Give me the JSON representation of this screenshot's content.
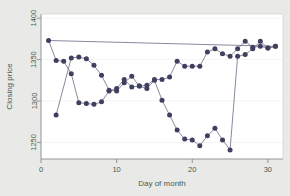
{
  "chart_data": {
    "type": "line",
    "title": "",
    "xlabel": "Day of month",
    "ylabel": "Closing price",
    "xlim": [
      0,
      32
    ],
    "ylim": [
      1230,
      1405
    ],
    "xticks": [
      0,
      10,
      20,
      30
    ],
    "xtick_labels": [
      "0",
      "10",
      "20",
      "30"
    ],
    "yticks": [
      1250,
      1300,
      1350,
      1400
    ],
    "ytick_labels": [
      "1250",
      "1300",
      "1350",
      "1400"
    ],
    "grid": false,
    "legend": "none",
    "marker": "filled-circle",
    "marker_color": "#3f3f5f",
    "line_color": "#6b6b84",
    "series": [
      {
        "name": "series-a",
        "x": [
          1,
          2,
          3,
          4,
          5,
          6,
          7,
          8,
          9,
          10,
          11,
          12,
          13,
          14,
          15,
          16,
          17,
          18,
          19,
          20,
          21,
          22,
          23,
          24,
          25,
          26,
          27,
          28,
          29,
          30,
          31
        ],
        "values": [
          1373,
          1349,
          1348,
          1333,
          1298,
          1297,
          1296,
          1299,
          1312,
          1315,
          1326,
          1317,
          1318,
          1315,
          1325,
          1301,
          1283,
          1265,
          1254,
          1253,
          1246,
          1258,
          1267,
          1253,
          1241,
          1354,
          1356,
          1363,
          1372,
          1364,
          1366
        ]
      },
      {
        "name": "series-b",
        "x": [
          2,
          4,
          5,
          6,
          7,
          8,
          9,
          10,
          11,
          12,
          13,
          14,
          15,
          16,
          17,
          18,
          19,
          20,
          21,
          22,
          23,
          24,
          25,
          26,
          27,
          28,
          29,
          30,
          31
        ],
        "values": [
          1283,
          1352,
          1353,
          1351,
          1343,
          1331,
          1313,
          1312,
          1322,
          1330,
          1318,
          1319,
          1326,
          1326,
          1329,
          1348,
          1342,
          1342,
          1342,
          1359,
          1363,
          1357,
          1354,
          1363,
          1372,
          1365,
          1366,
          1364,
          1366
        ]
      }
    ],
    "trend_line": {
      "name": "trend-line",
      "x": [
        1,
        31
      ],
      "values": [
        1373,
        1366
      ],
      "color": "#7a7a96"
    }
  },
  "labels": {
    "xlabel": "Day of month",
    "ylabel": "Closing price"
  }
}
